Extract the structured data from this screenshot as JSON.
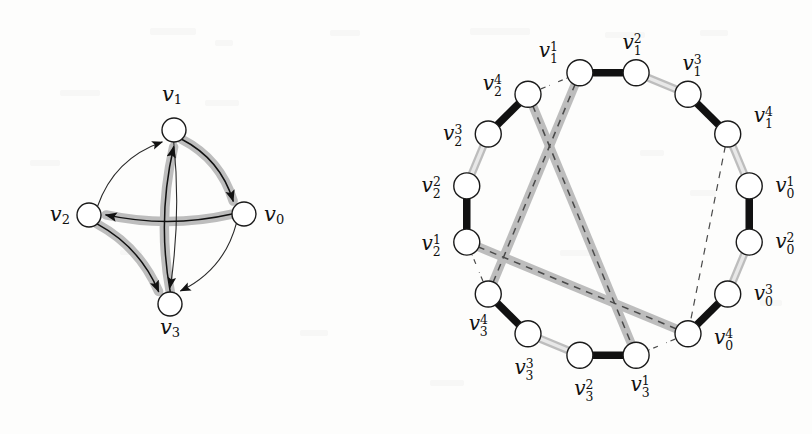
{
  "figure": {
    "title": "",
    "background_color": "#fdfdfc",
    "colors": {
      "node_fill": "#ffffff",
      "node_stroke": "#1a1a1a",
      "edge_black": "#111111",
      "edge_gray": "#b4b4b4",
      "halo_gray": "#bdbdbd",
      "dashed": "#4a4a4a",
      "thin_arc": "#2a2a2a",
      "label": "#101010"
    }
  },
  "left_graph": {
    "name": "directed-multigraph",
    "caption": "",
    "nodes": [
      {
        "id": "v1",
        "label_base": "v",
        "label_sub": "1",
        "x": 174,
        "y": 130,
        "label_x": 172,
        "label_y": 101,
        "label_anchor": "middle"
      },
      {
        "id": "v0",
        "label_base": "v",
        "label_sub": "0",
        "x": 244,
        "y": 214,
        "label_x": 264,
        "label_y": 221,
        "label_anchor": "start"
      },
      {
        "id": "v2",
        "label_base": "v",
        "label_sub": "2",
        "x": 89,
        "y": 215,
        "label_x": 70,
        "label_y": 221,
        "label_anchor": "end"
      },
      {
        "id": "v3",
        "label_base": "v",
        "label_sub": "3",
        "x": 170,
        "y": 304,
        "label_x": 170,
        "label_y": 334,
        "label_anchor": "middle"
      }
    ],
    "node_radius": 12,
    "edges": [
      {
        "from": "v1",
        "to": "v0",
        "style": "thick-halo",
        "arrow": true,
        "note": "outer right arc"
      },
      {
        "from": "v0",
        "to": "v2",
        "style": "thick-halo",
        "arrow": true,
        "note": "horizontal arc"
      },
      {
        "from": "v2",
        "to": "v3",
        "style": "thick-halo",
        "arrow": true,
        "note": "outer lower-left arc"
      },
      {
        "from": "v3",
        "to": "v1",
        "style": "thick-halo",
        "arrow": true,
        "note": "vertical arc"
      },
      {
        "from": "v2",
        "to": "v1",
        "style": "thin",
        "arrow": true,
        "note": "thin upper-left arc"
      },
      {
        "from": "v1",
        "to": "v3",
        "style": "thin",
        "arrow": true,
        "note": "thin vertical arc"
      },
      {
        "from": "v0",
        "to": "v3",
        "style": "thin",
        "arrow": true,
        "note": "thin lower-right arc"
      }
    ]
  },
  "right_graph": {
    "name": "cycle-expansion-graph",
    "caption": "",
    "center_x": 608,
    "center_y": 214,
    "radius": 144,
    "node_radius": 13,
    "nodes": [
      {
        "id": "v1_2",
        "label_base": "v",
        "label_sub": "1",
        "label_sup": "2",
        "angle": -78.75,
        "label_dx": -4,
        "label_dy": -24,
        "anchor": "middle"
      },
      {
        "id": "v1_3",
        "label_base": "v",
        "label_sub": "1",
        "label_sup": "3",
        "angle": -56.25,
        "label_dx": 4,
        "label_dy": -24,
        "anchor": "middle"
      },
      {
        "id": "v1_4",
        "label_base": "v",
        "label_sub": "1",
        "label_sup": "4",
        "angle": -33.75,
        "label_dx": 26,
        "label_dy": -12,
        "anchor": "start"
      },
      {
        "id": "v0_1",
        "label_base": "v",
        "label_sub": "0",
        "label_sup": "1",
        "angle": -11.25,
        "label_dx": 26,
        "label_dy": 6,
        "anchor": "start"
      },
      {
        "id": "v0_2",
        "label_base": "v",
        "label_sub": "0",
        "label_sup": "2",
        "angle": 11.25,
        "label_dx": 26,
        "label_dy": 6,
        "anchor": "start"
      },
      {
        "id": "v0_3",
        "label_base": "v",
        "label_sub": "0",
        "label_sup": "3",
        "angle": 33.75,
        "label_dx": 26,
        "label_dy": 6,
        "anchor": "start"
      },
      {
        "id": "v0_4",
        "label_base": "v",
        "label_sub": "0",
        "label_sup": "4",
        "angle": 56.25,
        "label_dx": 26,
        "label_dy": 10,
        "anchor": "start"
      },
      {
        "id": "v3_1",
        "label_base": "v",
        "label_sub": "3",
        "label_sup": "1",
        "angle": 78.75,
        "label_dx": 4,
        "label_dy": 36,
        "anchor": "middle"
      },
      {
        "id": "v3_2",
        "label_base": "v",
        "label_sub": "3",
        "label_sup": "2",
        "angle": 101.25,
        "label_dx": 4,
        "label_dy": 40,
        "anchor": "middle"
      },
      {
        "id": "v3_3",
        "label_base": "v",
        "label_sub": "3",
        "label_sup": "3",
        "angle": 123.75,
        "label_dx": -4,
        "label_dy": 40,
        "anchor": "middle"
      },
      {
        "id": "v3_4",
        "label_base": "v",
        "label_sub": "3",
        "label_sup": "4",
        "angle": 146.25,
        "label_dx": -10,
        "label_dy": 36,
        "anchor": "middle"
      },
      {
        "id": "v2_1",
        "label_base": "v",
        "label_sub": "2",
        "label_sup": "1",
        "angle": 168.75,
        "label_dx": -26,
        "label_dy": 8,
        "anchor": "end"
      },
      {
        "id": "v2_2",
        "label_base": "v",
        "label_sub": "2",
        "label_sup": "2",
        "angle": -168.75,
        "label_dx": -26,
        "label_dy": 6,
        "anchor": "end"
      },
      {
        "id": "v2_3",
        "label_base": "v",
        "label_sub": "2",
        "label_sup": "3",
        "angle": -146.25,
        "label_dx": -26,
        "label_dy": 6,
        "anchor": "end"
      },
      {
        "id": "v2_4",
        "label_base": "v",
        "label_sub": "2",
        "label_sup": "4",
        "angle": -123.75,
        "label_dx": -26,
        "label_dy": -4,
        "anchor": "end"
      },
      {
        "id": "v1_1",
        "label_base": "v",
        "label_sub": "1",
        "label_sup": "1",
        "angle": -101.25,
        "label_dx": -22,
        "label_dy": -16,
        "anchor": "end"
      }
    ],
    "ring_edges": [
      {
        "from": "v1_1",
        "to": "v1_2",
        "style": "black"
      },
      {
        "from": "v1_2",
        "to": "v1_3",
        "style": "gray"
      },
      {
        "from": "v1_3",
        "to": "v1_4",
        "style": "black"
      },
      {
        "from": "v1_4",
        "to": "v0_1",
        "style": "gray"
      },
      {
        "from": "v0_1",
        "to": "v0_2",
        "style": "black"
      },
      {
        "from": "v0_2",
        "to": "v0_3",
        "style": "gray"
      },
      {
        "from": "v0_3",
        "to": "v0_4",
        "style": "black"
      },
      {
        "from": "v0_4",
        "to": "v3_1",
        "style": "dashed-stub"
      },
      {
        "from": "v3_1",
        "to": "v3_2",
        "style": "black"
      },
      {
        "from": "v3_2",
        "to": "v3_3",
        "style": "gray"
      },
      {
        "from": "v3_3",
        "to": "v3_4",
        "style": "black"
      },
      {
        "from": "v3_4",
        "to": "v2_1",
        "style": "dashed-stub"
      },
      {
        "from": "v2_1",
        "to": "v2_2",
        "style": "black"
      },
      {
        "from": "v2_2",
        "to": "v2_3",
        "style": "gray"
      },
      {
        "from": "v2_3",
        "to": "v2_4",
        "style": "black"
      },
      {
        "from": "v2_4",
        "to": "v1_1",
        "style": "dashed-stub"
      }
    ],
    "chords": [
      {
        "from": "v1_1",
        "to": "v3_4",
        "style": "dashed-halo",
        "note": "vertical left chord"
      },
      {
        "from": "v2_1",
        "to": "v0_4",
        "style": "dashed-halo",
        "note": "horizontal chord"
      },
      {
        "from": "v2_4",
        "to": "v3_1",
        "style": "dashed-halo",
        "note": "diagonal chord"
      },
      {
        "from": "v1_4",
        "to": "v0_4",
        "style": "dashed-thin",
        "note": "vertical right chord, no halo"
      }
    ]
  }
}
